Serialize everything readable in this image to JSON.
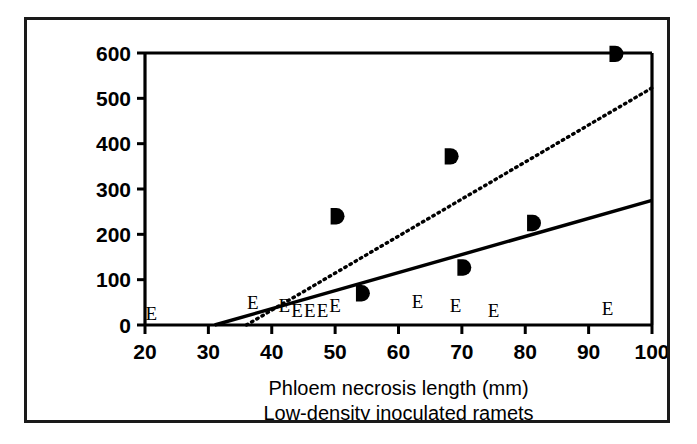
{
  "chart_data": {
    "type": "scatter",
    "title": "",
    "xlabel": "Phloem necrosis length (mm)",
    "sublabel": "Low-density inoculated ramets",
    "ylabel": "",
    "xlim": [
      20,
      100
    ],
    "ylim": [
      0,
      600
    ],
    "xticks": [
      20,
      30,
      40,
      50,
      60,
      70,
      80,
      90,
      100
    ],
    "yticks": [
      0,
      100,
      200,
      300,
      400,
      500,
      600
    ],
    "xtick_labels": [
      "20",
      "30",
      "40",
      "50",
      "60",
      "70",
      "80",
      "90",
      "100"
    ],
    "ytick_labels": [
      "0",
      "100",
      "200",
      "300",
      "400",
      "500",
      "600"
    ],
    "grid": false,
    "legend": "none",
    "series": [
      {
        "name": "D",
        "marker": "filled-D",
        "color": "#000000",
        "points": [
          {
            "x": 50,
            "y": 240
          },
          {
            "x": 54,
            "y": 70
          },
          {
            "x": 68,
            "y": 372
          },
          {
            "x": 70,
            "y": 127
          },
          {
            "x": 81,
            "y": 225
          },
          {
            "x": 94,
            "y": 598
          }
        ]
      },
      {
        "name": "E",
        "marker": "letter-E",
        "color": "#000000",
        "points": [
          {
            "x": 21,
            "y": 10
          },
          {
            "x": 37,
            "y": 35
          },
          {
            "x": 42,
            "y": 28
          },
          {
            "x": 44,
            "y": 18
          },
          {
            "x": 46,
            "y": 18
          },
          {
            "x": 48,
            "y": 18
          },
          {
            "x": 50,
            "y": 28
          },
          {
            "x": 63,
            "y": 38
          },
          {
            "x": 69,
            "y": 28
          },
          {
            "x": 75,
            "y": 18
          },
          {
            "x": 93,
            "y": 22
          }
        ]
      }
    ],
    "trendlines": [
      {
        "name": "solid-regression",
        "style": "solid",
        "color": "#000000",
        "x1": 31,
        "y1": 0,
        "x2": 100,
        "y2": 275
      },
      {
        "name": "dotted-regression",
        "style": "dotted",
        "color": "#000000",
        "x1": 36,
        "y1": 0,
        "x2": 100,
        "y2": 523
      }
    ]
  }
}
